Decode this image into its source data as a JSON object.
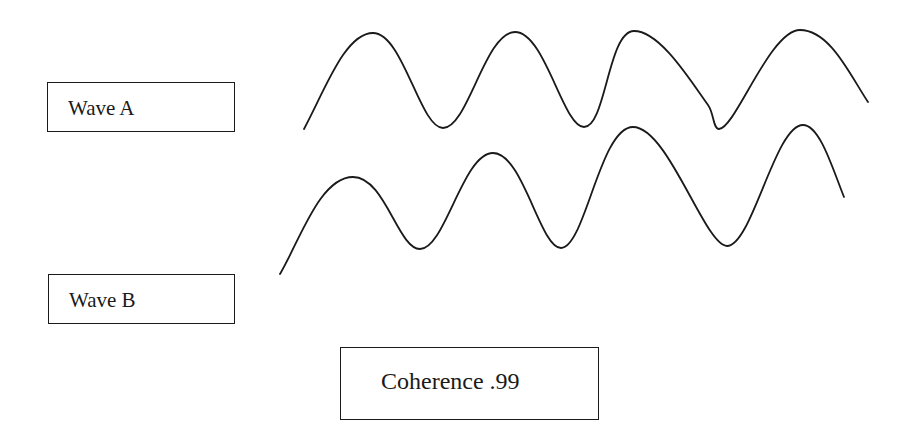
{
  "labels": {
    "wave_a": "Wave A",
    "wave_b": "Wave B",
    "coherence": "Coherence .99"
  },
  "colors": {
    "stroke": "#1a1a1a",
    "background": "#ffffff"
  },
  "waves": {
    "wave_a": {
      "path": "M304,129 C325,90 345,33 373,33 C403,33 420,128 443,128 C468,128 485,32 515,32 C545,32 563,127 584,127 C606,127 608,31 634,31 C660,31 690,80 708,105 C714,113 713,129 719,129 C735,129 770,30 800,30 C830,30 850,75 868,102"
    },
    "wave_b": {
      "path": "M280,274 C300,240 320,177 353,177 C385,177 398,249 420,249 C445,249 463,153 493,153 C523,153 540,248 561,248 C585,248 600,127 633,127 C668,127 705,246 727,246 C752,246 775,125 803,125 C820,125 833,170 844,197"
    }
  }
}
